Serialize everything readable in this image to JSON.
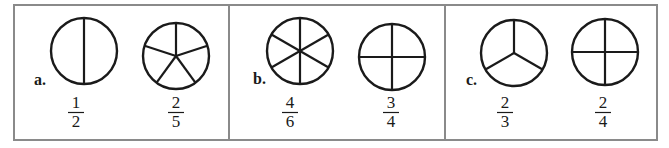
{
  "diagram": {
    "frame": {
      "x": 14,
      "y": 5,
      "width": 643,
      "height": 135,
      "border_color": "#8a8a8a"
    },
    "dividers_x": [
      229,
      445
    ],
    "stroke_color": "#1a1a1a",
    "panels": [
      {
        "label": "a.",
        "label_pos": [
          34,
          85
        ],
        "circles": [
          {
            "cx": 84,
            "cy": 51,
            "r": 33,
            "parts": 2,
            "division": "halves",
            "fraction": {
              "numerator": "1",
              "denominator": "2",
              "x": 76
            }
          },
          {
            "cx": 176,
            "cy": 56,
            "r": 33,
            "parts": 5,
            "division": "fifths",
            "fraction": {
              "numerator": "2",
              "denominator": "5",
              "x": 176
            }
          }
        ]
      },
      {
        "label": "b.",
        "label_pos": [
          253,
          84
        ],
        "circles": [
          {
            "cx": 300,
            "cy": 51,
            "r": 33,
            "parts": 6,
            "division": "sixths",
            "fraction": {
              "numerator": "4",
              "denominator": "6",
              "x": 290
            }
          },
          {
            "cx": 392,
            "cy": 57,
            "r": 33,
            "parts": 4,
            "division": "quarters",
            "fraction": {
              "numerator": "3",
              "denominator": "4",
              "x": 391
            }
          }
        ]
      },
      {
        "label": "c.",
        "label_pos": [
          466,
          85
        ],
        "circles": [
          {
            "cx": 514,
            "cy": 53,
            "r": 33,
            "parts": 3,
            "division": "thirds",
            "fraction": {
              "numerator": "2",
              "denominator": "3",
              "x": 505
            }
          },
          {
            "cx": 605,
            "cy": 52,
            "r": 33,
            "parts": 4,
            "division": "quarters",
            "fraction": {
              "numerator": "2",
              "denominator": "4",
              "x": 603
            }
          }
        ]
      }
    ]
  }
}
